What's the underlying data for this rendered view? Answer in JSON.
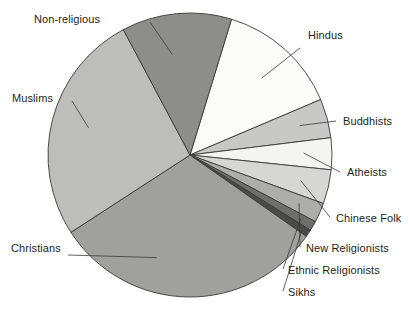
{
  "chart_data": {
    "type": "pie",
    "title": "",
    "subtitle": "",
    "xlabel": "",
    "ylabel": "",
    "legend_position": "none",
    "labels_position": "outside-with-leader-lines",
    "grid": false,
    "units": "percent of world population",
    "start_angle_deg_from_top": 17,
    "direction": "clockwise",
    "center_px": [
      190,
      155
    ],
    "radius_px": 142,
    "categories": [
      "Hindus",
      "Buddhists",
      "Atheists",
      "Chinese Folk",
      "New Religionists",
      "Ethnic Religionists",
      "Sikhs",
      "Christians",
      "Muslims",
      "Non-religious"
    ],
    "values": [
      13.9,
      4.4,
      3.6,
      3.9,
      2.2,
      1.1,
      0.8,
      31.1,
      26.4,
      12.6
    ],
    "colors": [
      "#fbfbfa",
      "#c8c8c6",
      "#f4f4f2",
      "#d6d6d3",
      "#adadaa",
      "#6e6e6c",
      "#4a4a48",
      "#a0a09d",
      "#bdbdba",
      "#8d8d8a"
    ],
    "slice_angles_deg": [
      {
        "label": "Hindus",
        "start": 17,
        "end": 67
      },
      {
        "label": "Buddhists",
        "start": 67,
        "end": 83
      },
      {
        "label": "Atheists",
        "start": 83,
        "end": 96
      },
      {
        "label": "Chinese Folk",
        "start": 96,
        "end": 110
      },
      {
        "label": "New Religionists",
        "start": 110,
        "end": 118
      },
      {
        "label": "Ethnic Religionists",
        "start": 118,
        "end": 122
      },
      {
        "label": "Sikhs",
        "start": 122,
        "end": 125
      },
      {
        "label": "Christians",
        "start": 125,
        "end": 237
      },
      {
        "label": "Muslims",
        "start": 237,
        "end": 332
      },
      {
        "label": "Non-religious",
        "start": 332,
        "end": 377
      }
    ]
  },
  "labels": {
    "non_religious": "Non-religious",
    "muslims": "Muslims",
    "christians": "Christians",
    "hindus": "Hindus",
    "buddhists": "Buddhists",
    "atheists": "Atheists",
    "chinese_folk": "Chinese Folk",
    "new_religionists": "New Religionists",
    "ethnic_religionists": "Ethnic Religionists",
    "sikhs": "Sikhs"
  }
}
